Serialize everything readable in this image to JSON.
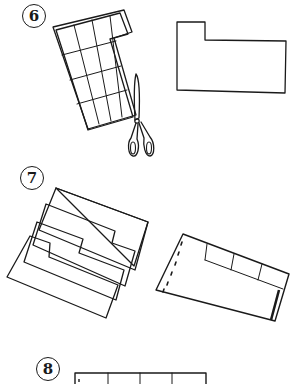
{
  "steps": [
    {
      "number": "6",
      "description": "Cut the grid sheet to form an L-shaped piece"
    },
    {
      "number": "7",
      "description": "Stack tabbed sheets and bind into a folder"
    },
    {
      "number": "8",
      "description": "Grid sheet (partially visible)"
    }
  ],
  "colors": {
    "ink": "#1a1a1a",
    "background": "#ffffff"
  }
}
